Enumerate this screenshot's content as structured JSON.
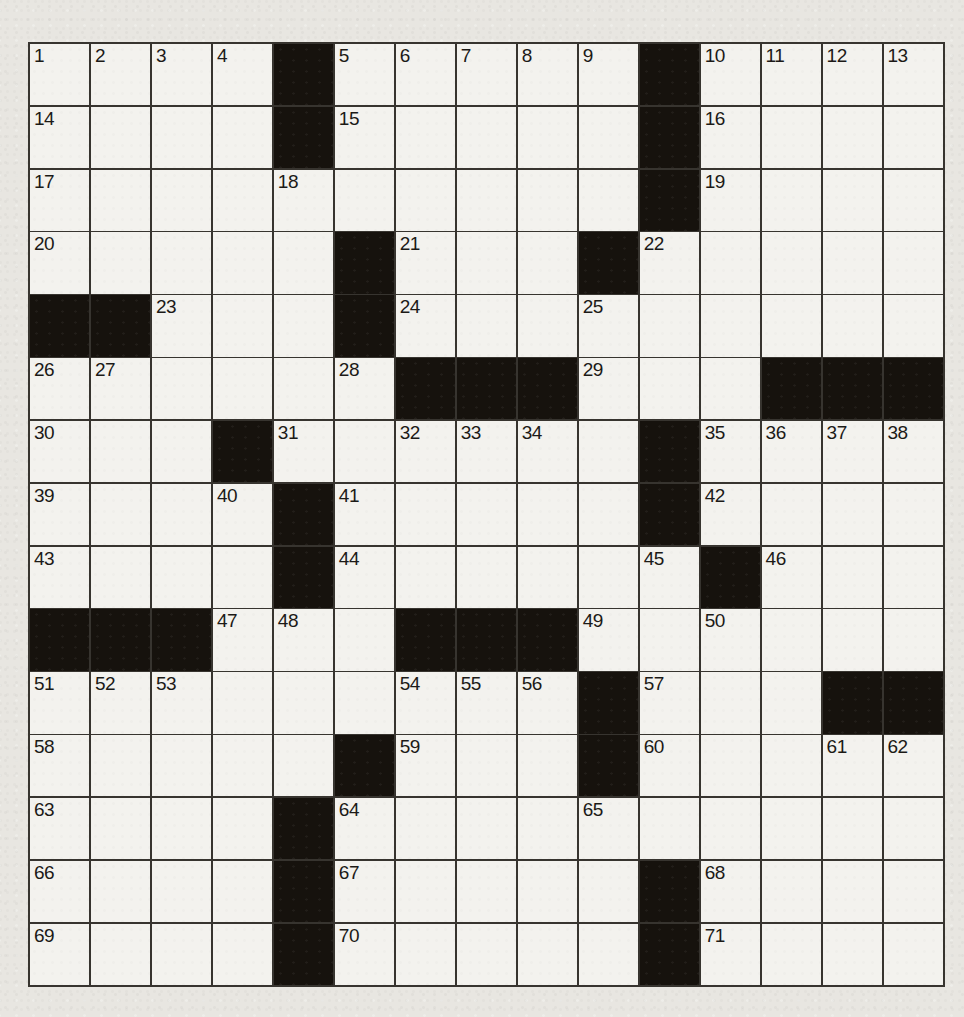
{
  "puzzle": {
    "type": "crossword",
    "rows": 15,
    "cols": 15,
    "first_number": 1,
    "last_number": 71,
    "grid": [
      [
        "1",
        "2",
        "3",
        "4",
        "#",
        "5",
        "6",
        "7",
        "8",
        "9",
        "#",
        "10",
        "11",
        "12",
        "13"
      ],
      [
        "14",
        "",
        "",
        "",
        "#",
        "15",
        "",
        "",
        "",
        "",
        "#",
        "16",
        "",
        "",
        ""
      ],
      [
        "17",
        "",
        "",
        "",
        "18",
        "",
        "",
        "",
        "",
        "",
        "#",
        "19",
        "",
        "",
        ""
      ],
      [
        "20",
        "",
        "",
        "",
        "",
        "#",
        "21",
        "",
        "",
        "#",
        "22",
        "",
        "",
        "",
        ""
      ],
      [
        "#",
        "#",
        "23",
        "",
        "",
        "#",
        "24",
        "",
        "",
        "25",
        "",
        "",
        "",
        "",
        ""
      ],
      [
        "26",
        "27",
        "",
        "",
        "",
        "28",
        "#",
        "#",
        "#",
        "29",
        "",
        "",
        "#",
        "#",
        "#"
      ],
      [
        "30",
        "",
        "",
        "#",
        "31",
        "",
        "32",
        "33",
        "34",
        "",
        "#",
        "35",
        "36",
        "37",
        "38"
      ],
      [
        "39",
        "",
        "",
        "40",
        "#",
        "41",
        "",
        "",
        "",
        "",
        "#",
        "42",
        "",
        "",
        ""
      ],
      [
        "43",
        "",
        "",
        "",
        "#",
        "44",
        "",
        "",
        "",
        "",
        "45",
        "#",
        "46",
        "",
        ""
      ],
      [
        "#",
        "#",
        "#",
        "47",
        "48",
        "",
        "#",
        "#",
        "#",
        "49",
        "",
        "50",
        "",
        "",
        ""
      ],
      [
        "51",
        "52",
        "53",
        "",
        "",
        "",
        "54",
        "55",
        "56",
        "#",
        "57",
        "",
        "",
        "#",
        "#"
      ],
      [
        "58",
        "",
        "",
        "",
        "",
        "#",
        "59",
        "",
        "",
        "#",
        "60",
        "",
        "",
        "61",
        "62"
      ],
      [
        "63",
        "",
        "",
        "",
        "#",
        "64",
        "",
        "",
        "",
        "65",
        "",
        "",
        "",
        "",
        ""
      ],
      [
        "66",
        "",
        "",
        "",
        "#",
        "67",
        "",
        "",
        "",
        "",
        "#",
        "68",
        "",
        "",
        ""
      ],
      [
        "69",
        "",
        "",
        "",
        "#",
        "70",
        "",
        "",
        "",
        "",
        "#",
        "71",
        "",
        "",
        ""
      ]
    ]
  },
  "colors": {
    "paper": "#e8e6e1",
    "cell": "#f3f2ee",
    "black": "#16120d",
    "line": "#37342f",
    "number": "#1c1a17"
  }
}
